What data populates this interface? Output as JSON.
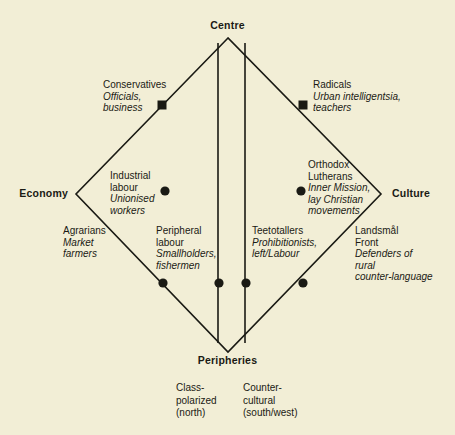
{
  "figure": {
    "background_color": "#f2eed6",
    "ink_color": "#1a1a14",
    "type": "cleavage-diamond"
  },
  "axes": {
    "top": "Centre",
    "bottom": "Peripheries",
    "left": "Economy",
    "right": "Culture"
  },
  "nodes": [
    {
      "id": "conservatives",
      "title": "Conservatives",
      "desc": "Officials,\nbusiness",
      "desc_lines": [
        "Officials,",
        "business"
      ],
      "marker": "square",
      "edge": "upper-left"
    },
    {
      "id": "radicals",
      "title": "Radicals",
      "desc_lines": [
        "Urban intelligentsia,",
        "teachers"
      ],
      "marker": "square",
      "edge": "upper-right"
    },
    {
      "id": "industrial-labour",
      "title_lines": [
        "Industrial",
        "labour"
      ],
      "desc_lines": [
        "Unionised",
        "workers"
      ],
      "marker": "dot",
      "edge": "interior-left"
    },
    {
      "id": "orthodox-lutherans",
      "title_lines": [
        "Orthodox",
        "Lutherans"
      ],
      "desc_lines": [
        "Inner Mission,",
        "lay Christian",
        "movements"
      ],
      "marker": "dot",
      "edge": "interior-right"
    },
    {
      "id": "agrarians",
      "title_lines": [
        "Agrarians"
      ],
      "desc_lines": [
        "Market",
        "farmers"
      ],
      "marker": "none",
      "edge": "lower-left-outer"
    },
    {
      "id": "peripheral-labour",
      "title_lines": [
        "Peripheral",
        "labour"
      ],
      "desc_lines": [
        "Smallholders,",
        "fishermen"
      ],
      "marker": "dot",
      "edge": "lower-left"
    },
    {
      "id": "teetotallers",
      "title_lines": [
        "Teetotallers"
      ],
      "desc_lines": [
        "Prohibitionists,",
        "left/Labour"
      ],
      "marker": "dot",
      "edge": "lower-right-inner"
    },
    {
      "id": "landsmal-front",
      "title_lines": [
        "Landsmål",
        "Front"
      ],
      "desc_lines": [
        "Defenders of",
        "rural",
        "counter-language"
      ],
      "marker": "dot",
      "edge": "lower-right"
    }
  ],
  "footnotes": [
    {
      "id": "class-polarized",
      "lines": [
        "Class-",
        "polarized",
        "(north)"
      ]
    },
    {
      "id": "counter-cultural",
      "lines": [
        "Counter-",
        "cultural",
        "(south/west)"
      ]
    }
  ],
  "geometry": {
    "top_vertex": [
      228,
      38
    ],
    "bottom_vertex": [
      228,
      352
    ],
    "left_vertex": [
      76,
      194
    ],
    "right_vertex": [
      381,
      194
    ],
    "vertical_left_x": 218,
    "vertical_right_x": 245,
    "markers": [
      {
        "shape": "square",
        "x": 162,
        "y": 105
      },
      {
        "shape": "square",
        "x": 303,
        "y": 105
      },
      {
        "shape": "dot",
        "x": 165,
        "y": 191
      },
      {
        "shape": "dot",
        "x": 301,
        "y": 191
      },
      {
        "shape": "dot",
        "x": 163,
        "y": 283
      },
      {
        "shape": "dot",
        "x": 219,
        "y": 283
      },
      {
        "shape": "dot",
        "x": 246,
        "y": 283
      },
      {
        "shape": "dot",
        "x": 303,
        "y": 283
      }
    ]
  }
}
